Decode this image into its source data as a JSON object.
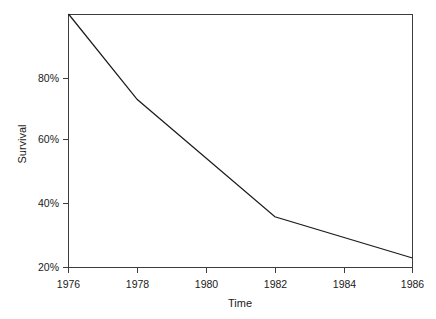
{
  "chart_data": {
    "type": "line",
    "title": "",
    "xlabel": "Time",
    "ylabel": "Survival",
    "x": [
      1976,
      1978,
      1982,
      1986
    ],
    "values": [
      100,
      73,
      36,
      23
    ],
    "series": [
      {
        "name": "Survival",
        "values": [
          100,
          73,
          36,
          23
        ]
      }
    ],
    "xlim": [
      1976,
      1986
    ],
    "ylim": [
      20,
      100
    ],
    "xticks": [
      1976,
      1978,
      1980,
      1982,
      1984,
      1986
    ],
    "xticklabels": [
      "1976",
      "1978",
      "1980",
      "1982",
      "1984",
      "1986"
    ],
    "yticks": [
      20,
      40,
      60,
      80
    ],
    "yticklabels": [
      "20%",
      "40%",
      "60%",
      "80%"
    ],
    "grid": false,
    "legend": "none",
    "line_color": "#1c1c1c",
    "axis_color": "#3c3c3c",
    "background": "#ffffff",
    "frame": "box-top-right-open-left-bottom-axes"
  },
  "axes": {
    "x_title": "Time",
    "y_title": "Survival"
  },
  "y_tick_labels": {
    "t0": "20%",
    "t1": "40%",
    "t2": "60%",
    "t3": "80%"
  },
  "x_tick_labels": {
    "t0": "1976",
    "t1": "1978",
    "t2": "1980",
    "t3": "1982",
    "t4": "1984",
    "t5": "1986"
  }
}
